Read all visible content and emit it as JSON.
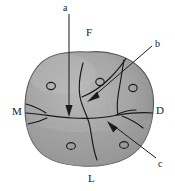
{
  "figure": {
    "type": "anatomical-line-drawing",
    "background_color": "#ffffff",
    "ink_color": "#1a1a1a",
    "fill_color": "#a9a9a9",
    "fill_color_light": "#b8b8b8",
    "fill_color_dark": "#8e8e8e",
    "rim_color": "#6e6e6e"
  },
  "labels": {
    "region": [
      {
        "id": "F",
        "text": "F",
        "meaning": "frontal-region",
        "position": "top"
      },
      {
        "id": "M",
        "text": "M",
        "meaning": "medial-left-region",
        "position": "left"
      },
      {
        "id": "D",
        "text": "D",
        "meaning": "right-lateral-region",
        "position": "right"
      },
      {
        "id": "L",
        "text": "L",
        "meaning": "lower-occipital-region",
        "position": "bottom"
      }
    ],
    "callout": [
      {
        "id": "a",
        "text": "a",
        "meaning": "callout-a-top",
        "position": "top-left"
      },
      {
        "id": "b",
        "text": "b",
        "meaning": "callout-b-upper-right",
        "position": "top-right"
      },
      {
        "id": "c",
        "text": "c",
        "meaning": "callout-c-lower-right",
        "position": "bottom-right"
      }
    ]
  },
  "features": {
    "foramina_count": 6,
    "suture_count": 4,
    "leader_line_count": 3
  }
}
